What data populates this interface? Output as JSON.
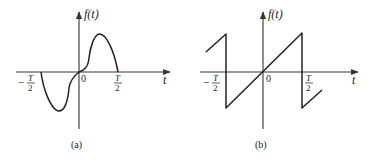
{
  "figures": [
    {
      "id": "a",
      "caption": "(a)",
      "y_label": "f(t)",
      "x_label": "t",
      "origin_label": "0",
      "tick_neg": {
        "num": "T",
        "den": "2",
        "sign": "−"
      },
      "tick_pos": {
        "num": "T",
        "den": "2"
      },
      "description": "odd-symmetric pulse: negative lobe on (-T/2,0), positive lobe on (0,T/2)"
    },
    {
      "id": "b",
      "caption": "(b)",
      "y_label": "f(t)",
      "x_label": "t",
      "origin_label": "0",
      "tick_neg": {
        "num": "T",
        "den": "2",
        "sign": "−"
      },
      "tick_pos": {
        "num": "T",
        "den": "2"
      },
      "description": "sawtooth wave, linear ramp through origin with jumps at ±T/2"
    }
  ],
  "colors": {
    "ink": "#222222",
    "background": "#ffffff"
  }
}
